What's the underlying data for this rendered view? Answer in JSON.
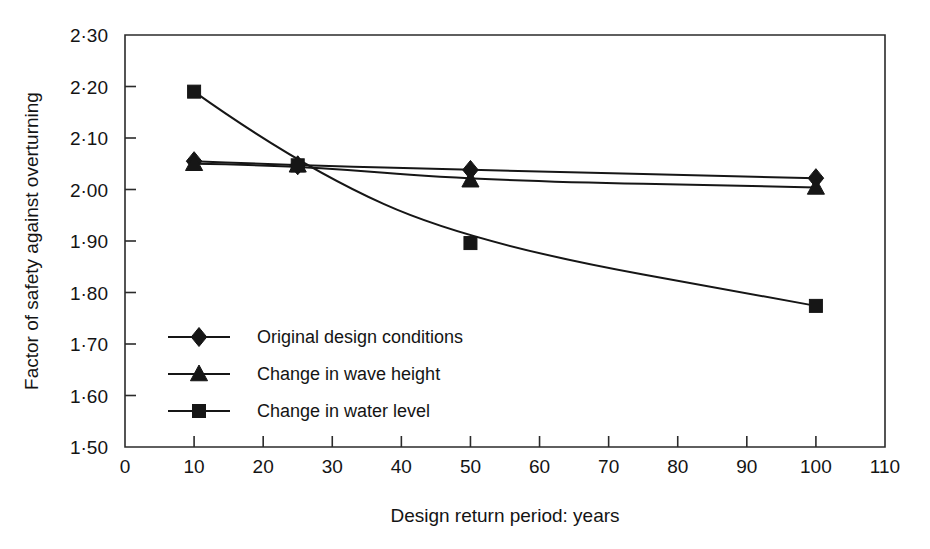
{
  "chart_data": {
    "type": "line",
    "title": "",
    "xlabel": "Design return period: years",
    "ylabel": "Factor of safety against overturning",
    "xlim": [
      0,
      110
    ],
    "ylim": [
      1.5,
      2.3
    ],
    "grid": false,
    "legend_position": "inside-left",
    "x_ticks": [
      0,
      10,
      20,
      30,
      40,
      50,
      60,
      70,
      80,
      90,
      100,
      110
    ],
    "x_tick_labels": [
      "0",
      "10",
      "20",
      "30",
      "40",
      "50",
      "60",
      "70",
      "80",
      "90",
      "100",
      "110"
    ],
    "y_ticks": [
      1.5,
      1.6,
      1.7,
      1.8,
      1.9,
      2.0,
      2.1,
      2.2,
      2.3
    ],
    "y_tick_labels": [
      "1·50",
      "1·60",
      "1·70",
      "1·80",
      "1·90",
      "2·00",
      "2·10",
      "2·20",
      "2·30"
    ],
    "series": [
      {
        "name": "Original design conditions",
        "marker": "diamond",
        "x": [
          10,
          25,
          50,
          100
        ],
        "values": [
          2.055,
          2.047,
          2.038,
          2.022
        ]
      },
      {
        "name": "Change in wave height",
        "marker": "triangle",
        "x": [
          10,
          25,
          50,
          100
        ],
        "values": [
          2.05,
          2.047,
          2.018,
          2.004
        ]
      },
      {
        "name": "Change in water level",
        "marker": "square",
        "x": [
          10,
          25,
          50,
          100
        ],
        "values": [
          2.19,
          2.047,
          1.896,
          1.774
        ]
      }
    ]
  },
  "legend": {
    "entries": [
      {
        "label": "Original design conditions",
        "marker": "diamond"
      },
      {
        "label": "Change in wave height",
        "marker": "triangle"
      },
      {
        "label": "Change in water level",
        "marker": "square"
      }
    ]
  },
  "colors": {
    "ink": "#161616",
    "axis": "#2b2b2b",
    "background": "#ffffff"
  }
}
